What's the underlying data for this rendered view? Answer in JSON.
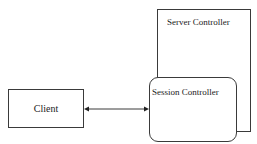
{
  "diagram": {
    "nodes": {
      "server": {
        "label": "Server Controller",
        "shape": "rectangle"
      },
      "session": {
        "label": "Session Controller",
        "shape": "rounded-rectangle",
        "contained_in": "server"
      },
      "client": {
        "label": "Client",
        "shape": "rectangle"
      }
    },
    "edges": [
      {
        "from": "client",
        "to": "session",
        "type": "bidirectional-arrow"
      }
    ],
    "colors": {
      "stroke": "#3a3a3a",
      "text": "#222222",
      "background": "#ffffff"
    }
  }
}
